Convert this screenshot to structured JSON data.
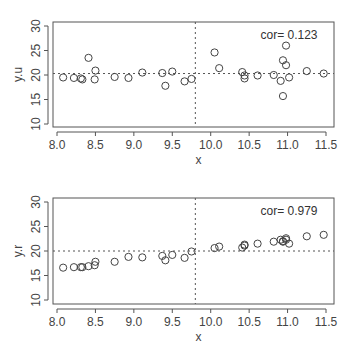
{
  "chart_data": [
    {
      "type": "scatter",
      "title": "",
      "xlabel": "x",
      "ylabel": "y.u",
      "xlim": [
        7.95,
        11.6
      ],
      "ylim": [
        9.5,
        30.5
      ],
      "xticks": [
        "8.0",
        "8.5",
        "9.0",
        "9.5",
        "10.0",
        "10.5",
        "11.0",
        "11.5"
      ],
      "yticks": [
        "10",
        "15",
        "20",
        "25",
        "30"
      ],
      "annotation": "cor= 0.123",
      "vline_x": 9.8,
      "hline_y": 20.3,
      "grid": false,
      "points": [
        [
          8.08,
          19.5
        ],
        [
          8.22,
          19.4
        ],
        [
          8.31,
          19.3
        ],
        [
          8.33,
          19.1
        ],
        [
          8.41,
          23.5
        ],
        [
          8.49,
          19.1
        ],
        [
          8.5,
          20.9
        ],
        [
          8.75,
          19.6
        ],
        [
          8.93,
          19.4
        ],
        [
          9.11,
          20.5
        ],
        [
          9.37,
          20.4
        ],
        [
          9.41,
          17.8
        ],
        [
          9.5,
          20.7
        ],
        [
          9.66,
          18.7
        ],
        [
          9.75,
          19.2
        ],
        [
          10.05,
          24.6
        ],
        [
          10.11,
          21.4
        ],
        [
          10.41,
          20.6
        ],
        [
          10.44,
          19.3
        ],
        [
          10.44,
          19.9
        ],
        [
          10.61,
          19.9
        ],
        [
          10.82,
          20.0
        ],
        [
          10.91,
          18.8
        ],
        [
          10.94,
          23.0
        ],
        [
          10.98,
          26.0
        ],
        [
          10.98,
          22.0
        ],
        [
          11.02,
          19.5
        ],
        [
          10.94,
          15.7
        ],
        [
          11.25,
          20.8
        ],
        [
          11.47,
          20.3
        ]
      ]
    },
    {
      "type": "scatter",
      "title": "",
      "xlabel": "x",
      "ylabel": "y.r",
      "xlim": [
        7.95,
        11.6
      ],
      "ylim": [
        9.5,
        30.5
      ],
      "xticks": [
        "8.0",
        "8.5",
        "9.0",
        "9.5",
        "10.0",
        "10.5",
        "11.0",
        "11.5"
      ],
      "yticks": [
        "10",
        "15",
        "20",
        "25",
        "30"
      ],
      "annotation": "cor= 0.979",
      "vline_x": 9.8,
      "hline_y": 20.0,
      "grid": false,
      "points": [
        [
          8.08,
          16.6
        ],
        [
          8.22,
          16.7
        ],
        [
          8.31,
          16.7
        ],
        [
          8.33,
          16.7
        ],
        [
          8.41,
          16.9
        ],
        [
          8.49,
          17.1
        ],
        [
          8.5,
          17.8
        ],
        [
          8.75,
          17.8
        ],
        [
          8.93,
          18.8
        ],
        [
          9.11,
          18.7
        ],
        [
          9.37,
          19.0
        ],
        [
          9.41,
          18.1
        ],
        [
          9.5,
          19.2
        ],
        [
          9.66,
          18.6
        ],
        [
          9.75,
          19.9
        ],
        [
          10.05,
          20.6
        ],
        [
          10.11,
          20.9
        ],
        [
          10.41,
          20.7
        ],
        [
          10.44,
          21.1
        ],
        [
          10.44,
          21.3
        ],
        [
          10.61,
          21.5
        ],
        [
          10.82,
          21.9
        ],
        [
          10.91,
          22.3
        ],
        [
          10.94,
          21.9
        ],
        [
          10.98,
          22.6
        ],
        [
          10.98,
          22.3
        ],
        [
          11.02,
          21.5
        ],
        [
          10.94,
          22.0
        ],
        [
          11.25,
          23.0
        ],
        [
          11.47,
          23.3
        ]
      ]
    }
  ]
}
